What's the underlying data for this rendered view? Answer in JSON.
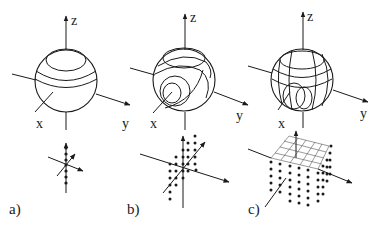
{
  "panels": [
    {
      "id": "a",
      "label": "a)",
      "axis_labels": {
        "z": "z",
        "x": "x",
        "y": "y"
      },
      "sphere_curves": "3 parallel latitude rings on upper hemisphere",
      "lattice": "1D column of dots along z-axis"
    },
    {
      "id": "b",
      "label": "b)",
      "axis_labels": {
        "z": "z",
        "x": "x",
        "y": "y"
      },
      "sphere_curves": "nested rings tilted around x-axis plus latitude rings",
      "lattice": "2D plane of dots (x-z)"
    },
    {
      "id": "c",
      "label": "c)",
      "axis_labels": {
        "z": "z",
        "x": "x",
        "y": "y"
      },
      "sphere_curves": "crossing latitude and longitude rings",
      "lattice": "3D cubic block of dots with grid on top face"
    }
  ],
  "colors": {
    "line": "#1a1a1a",
    "background": "#ffffff"
  }
}
